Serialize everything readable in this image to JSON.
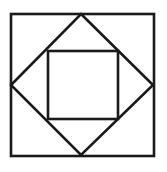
{
  "diagram": {
    "stroke_color": "#1a1a1a",
    "background": "#ffffff",
    "stroke_width": 2.6,
    "outer_square": {
      "x": 11,
      "y": 14,
      "width": 143,
      "height": 142
    },
    "diamond": {
      "points": "81,14 153,85 81,155 11,85"
    },
    "inner_square": {
      "x": 48,
      "y": 51,
      "width": 70,
      "height": 68
    }
  }
}
